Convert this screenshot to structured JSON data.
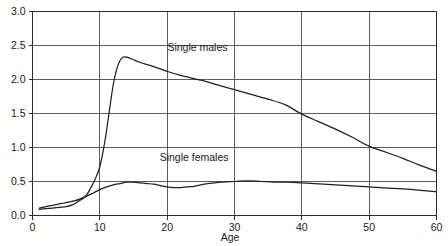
{
  "chart_data": {
    "type": "line",
    "title": "",
    "xlabel": "Age",
    "ylabel": "",
    "xlim": [
      0,
      60
    ],
    "ylim": [
      0.0,
      3.0
    ],
    "grid": true,
    "legend_position": "inline-annotation",
    "x_ticks": [
      0,
      10,
      20,
      30,
      40,
      50,
      60
    ],
    "x_tick_labels": [
      "0",
      "10",
      "20",
      "30",
      "40",
      "50",
      "60"
    ],
    "y_ticks": [
      0.0,
      0.5,
      1.0,
      1.5,
      2.0,
      2.5,
      3.0
    ],
    "y_tick_labels": [
      "0.0",
      "0.5",
      "1.0",
      "1.5",
      "2.0",
      "2.5",
      "3.0"
    ],
    "annotations": [
      {
        "text": "Single males",
        "x": 24.5,
        "y": 2.42
      },
      {
        "text": "Single females",
        "x": 24.0,
        "y": 0.8
      }
    ],
    "series": [
      {
        "name": "Single males",
        "x": [
          1.0,
          2.0,
          3.0,
          4.0,
          5.0,
          6.0,
          7.0,
          8.0,
          9.0,
          9.5,
          10.0,
          10.5,
          11.0,
          11.5,
          12.0,
          12.5,
          13.0,
          13.5,
          14.0,
          15.0,
          16.0,
          18.0,
          20.0,
          22.0,
          25.0,
          27.5,
          30.0,
          32.5,
          35.0,
          37.5,
          40.0,
          42.5,
          45.0,
          47.5,
          50.0,
          52.5,
          55.0,
          57.5,
          60.0
        ],
        "y": [
          0.11,
          0.13,
          0.15,
          0.17,
          0.19,
          0.21,
          0.24,
          0.3,
          0.47,
          0.58,
          0.72,
          0.95,
          1.25,
          1.6,
          1.93,
          2.15,
          2.28,
          2.33,
          2.33,
          2.29,
          2.25,
          2.19,
          2.12,
          2.06,
          1.99,
          1.92,
          1.85,
          1.78,
          1.71,
          1.63,
          1.49,
          1.38,
          1.27,
          1.15,
          1.02,
          0.93,
          0.84,
          0.74,
          0.65
        ]
      },
      {
        "name": "Single females",
        "x": [
          1.0,
          2.0,
          3.0,
          4.0,
          5.0,
          6.0,
          7.0,
          8.0,
          9.0,
          10.0,
          11.0,
          12.0,
          13.0,
          14.0,
          15.0,
          16.0,
          17.0,
          18.0,
          19.0,
          20.0,
          21.0,
          22.0,
          23.0,
          24.0,
          25.0,
          26.0,
          27.0,
          28.0,
          30.0,
          32.0,
          34.0,
          36.0,
          38.0,
          40.0,
          45.0,
          50.0,
          55.0,
          60.0
        ],
        "y": [
          0.09,
          0.1,
          0.11,
          0.12,
          0.13,
          0.16,
          0.22,
          0.28,
          0.33,
          0.38,
          0.42,
          0.45,
          0.47,
          0.49,
          0.49,
          0.48,
          0.47,
          0.46,
          0.44,
          0.42,
          0.41,
          0.41,
          0.42,
          0.43,
          0.45,
          0.47,
          0.48,
          0.49,
          0.5,
          0.51,
          0.5,
          0.49,
          0.49,
          0.48,
          0.45,
          0.42,
          0.39,
          0.35
        ]
      }
    ]
  }
}
